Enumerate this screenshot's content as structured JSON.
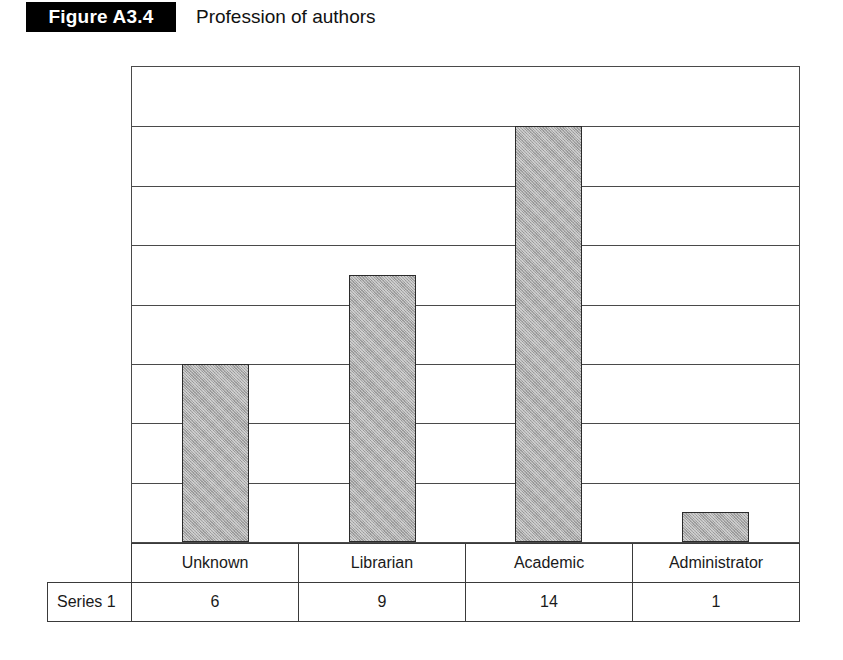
{
  "figure": {
    "tag": "Figure A3.4",
    "caption": "Profession of authors"
  },
  "chart_data": {
    "type": "bar",
    "title": "Profession of authors",
    "categories": [
      "Unknown",
      "Librarian",
      "Academic",
      "Administrator"
    ],
    "series": [
      {
        "name": "Series 1",
        "values": [
          6,
          9,
          14,
          1
        ]
      }
    ],
    "values": [
      6,
      9,
      14,
      1
    ],
    "xlabel": "",
    "ylabel": "",
    "ylim": [
      0,
      16
    ],
    "y_tick_step": 2,
    "y_tick_labels_visible": false,
    "grid": true,
    "gridlines_horizontal": 9,
    "legend": false,
    "legend_position": "none",
    "data_table_shown": true,
    "bar_fill_color": "#a9a9a9",
    "bar_border_color": "#2b2b2b",
    "grid_color": "#4a4a4a",
    "background_color": "#ffffff"
  },
  "data_table": {
    "series_label": "Series 1",
    "headers": [
      "Unknown",
      "Librarian",
      "Academic",
      "Administrator"
    ],
    "row_values": [
      "6",
      "9",
      "14",
      "1"
    ]
  }
}
